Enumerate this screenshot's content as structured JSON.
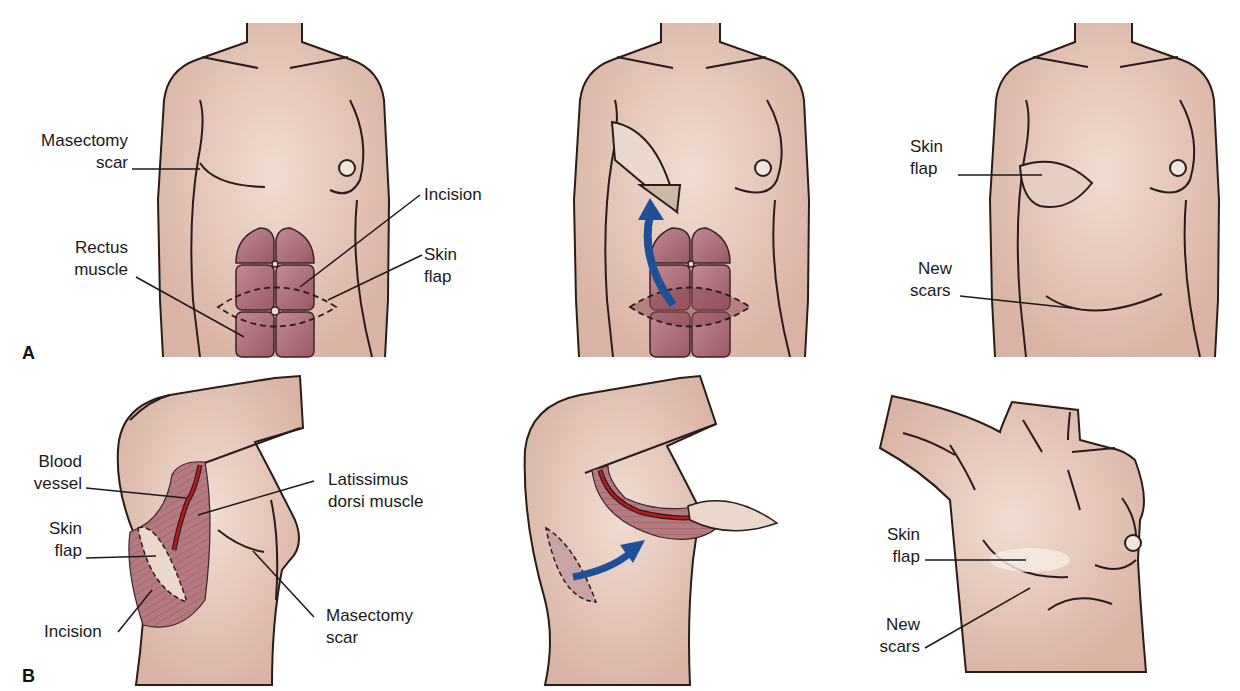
{
  "figure": {
    "panels": [
      {
        "letter": "A",
        "title": "TRAM flap reconstruction",
        "labels": {
          "masectomy_scar": "Masectomy\nscar",
          "masectomy_scar_l1": "Masectomy",
          "masectomy_scar_l2": "scar",
          "rectus_l1": "Rectus",
          "rectus_l2": "muscle",
          "incision": "Incision",
          "skin_flap_l1": "Skin",
          "skin_flap_l2": "flap",
          "result_skin_flap_l1": "Skin",
          "result_skin_flap_l2": "flap",
          "new_scars_l1": "New",
          "new_scars_l2": "scars"
        }
      },
      {
        "letter": "B",
        "title": "Latissimus dorsi flap reconstruction",
        "labels": {
          "blood_vessel_l1": "Blood",
          "blood_vessel_l2": "vessel",
          "skin_flap_l1": "Skin",
          "skin_flap_l2": "flap",
          "incision": "Incision",
          "latissimus_l1": "Latissimus",
          "latissimus_l2": "dorsi muscle",
          "masectomy_l1": "Masectomy",
          "masectomy_l2": "scar",
          "result_skin_flap_l1": "Skin",
          "result_skin_flap_l2": "flap",
          "new_scars_l1": "New",
          "new_scars_l2": "scars"
        }
      }
    ],
    "colors": {
      "skin": "#ead3c6",
      "skin_shadow": "#d9b5a5",
      "muscle": "#b0707a",
      "muscle_dark": "#8f4f5a",
      "vessel": "#c0181c",
      "arrow": "#1f4f99",
      "outline": "#2a1c18",
      "flap_graft": "#cbb9a6"
    }
  }
}
